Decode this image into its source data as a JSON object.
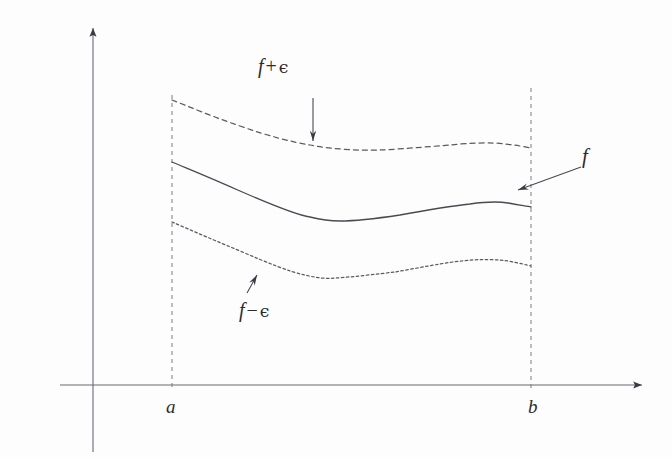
{
  "figure": {
    "background_color": "#fdfdfd",
    "ink_color": "#4a4a52",
    "label_color": "#2b2b30",
    "width": 672,
    "height": 457
  },
  "axes": {
    "x_axis": {
      "name": "x-axis",
      "y": 385,
      "x_start": 60,
      "x_end": 648,
      "has_arrowhead": true,
      "arrow_direction": "right"
    },
    "y_axis": {
      "name": "y-axis",
      "x": 93,
      "y_start": 22,
      "y_end": 452,
      "has_arrowhead": true,
      "arrow_direction": "up"
    }
  },
  "interval": {
    "left_endpoint": {
      "label": "a",
      "x": 172,
      "dashed_line_top": 95,
      "dashed_line_bottom": 388
    },
    "right_endpoint": {
      "label": "b",
      "x": 531,
      "dashed_line_top": 88,
      "dashed_line_bottom": 388
    }
  },
  "curves": [
    {
      "name": "upper-bound-curve",
      "label": "f + ϵ",
      "style": "dashed",
      "dash_pattern": "5,4",
      "points": [
        [
          172,
          100
        ],
        [
          205,
          113
        ],
        [
          240,
          126
        ],
        [
          275,
          137
        ],
        [
          310,
          145
        ],
        [
          345,
          149
        ],
        [
          380,
          150
        ],
        [
          415,
          148
        ],
        [
          450,
          145
        ],
        [
          480,
          143
        ],
        [
          505,
          144
        ],
        [
          531,
          148
        ]
      ]
    },
    {
      "name": "function-curve",
      "label": "f",
      "style": "solid",
      "points": [
        [
          172,
          162
        ],
        [
          205,
          176
        ],
        [
          240,
          191
        ],
        [
          275,
          206
        ],
        [
          310,
          217
        ],
        [
          335,
          221
        ],
        [
          365,
          220
        ],
        [
          400,
          215
        ],
        [
          435,
          209
        ],
        [
          470,
          204
        ],
        [
          495,
          202
        ],
        [
          515,
          204
        ],
        [
          531,
          207
        ]
      ]
    },
    {
      "name": "lower-bound-curve",
      "label": "f − ϵ",
      "style": "dotted",
      "dash_pattern": "2.5,2.5",
      "points": [
        [
          172,
          222
        ],
        [
          205,
          236
        ],
        [
          240,
          251
        ],
        [
          275,
          266
        ],
        [
          305,
          275
        ],
        [
          330,
          278
        ],
        [
          360,
          277
        ],
        [
          395,
          272
        ],
        [
          430,
          266
        ],
        [
          462,
          261
        ],
        [
          485,
          260
        ],
        [
          510,
          262
        ],
        [
          531,
          266
        ]
      ]
    }
  ],
  "annotations": [
    {
      "name": "f-plus-eps-label",
      "text_parts": {
        "var": "f",
        "op": "+",
        "eps": "ϵ"
      },
      "text": "f + ϵ",
      "x": 258,
      "y": 56
    },
    {
      "name": "f-plus-eps-arrow",
      "type": "arrow",
      "direction": "down",
      "from": [
        313,
        98
      ],
      "to": [
        313,
        143
      ],
      "points_to": "upper-bound-curve"
    },
    {
      "name": "f-minus-eps-label",
      "text_parts": {
        "var": "f",
        "op": "−",
        "eps": "ϵ"
      },
      "text": "f − ϵ",
      "x": 239,
      "y": 300
    },
    {
      "name": "f-minus-eps-arrow",
      "type": "arrow",
      "direction": "up-right",
      "from": [
        247,
        293
      ],
      "to": [
        257,
        273
      ],
      "points_to": "lower-bound-curve"
    },
    {
      "name": "f-label",
      "text_parts": {
        "var": "f",
        "op": "",
        "eps": ""
      },
      "text": "f",
      "x": 582,
      "y": 146
    },
    {
      "name": "f-arrow",
      "type": "arrow",
      "direction": "left-down",
      "from": [
        581,
        167
      ],
      "to": [
        516,
        191
      ],
      "points_to": "function-curve"
    }
  ],
  "tick_labels": {
    "a": "a",
    "b": "b"
  }
}
